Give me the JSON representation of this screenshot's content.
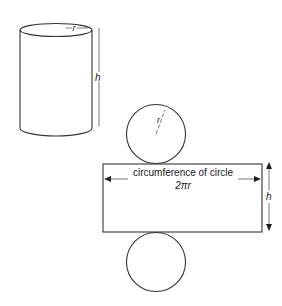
{
  "diagram": {
    "cylinder": {
      "radius_label": "r",
      "height_label": "h"
    },
    "net": {
      "top_circle": {
        "radius_label": "r"
      },
      "rectangle": {
        "width_label": "circumference of circle",
        "width_formula": "2πr",
        "height_label": "h"
      },
      "bottom_circle": {}
    },
    "colors": {
      "line": "#333333",
      "background": "#ffffff"
    }
  }
}
